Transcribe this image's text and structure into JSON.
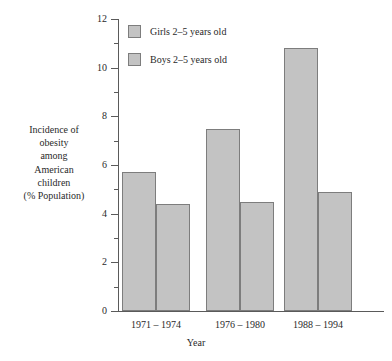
{
  "chart_data": {
    "type": "bar",
    "title": "",
    "xlabel": "Year",
    "ylabel": "Incidence of obesity among American children (% Population)",
    "ylabel_lines": [
      "Incidence of",
      "obesity",
      "among",
      "American",
      "children",
      "(% Population)"
    ],
    "categories": [
      "1971 – 1974",
      "1976 – 1980",
      "1988 – 1994"
    ],
    "series": [
      {
        "name": "Girls 2–5 years old",
        "values": [
          5.7,
          7.5,
          10.8
        ]
      },
      {
        "name": "Boys 2–5 years old",
        "values": [
          4.4,
          4.5,
          4.9
        ]
      }
    ],
    "ylim": [
      0,
      12
    ],
    "y_ticks_major": [
      0,
      2,
      4,
      6,
      8,
      10,
      12
    ],
    "y_tick_labels": [
      "0",
      "2",
      "4",
      "6",
      "8",
      "10",
      "12"
    ],
    "y_ticks_minor": [
      1,
      3,
      5,
      7,
      9,
      11
    ],
    "grid": false,
    "legend_position": "top-left",
    "bar_color": "#c3c3c3",
    "bar_border_color": "#7d7d7d",
    "axis_color": "#5a5a5a",
    "background": "#ffffff"
  }
}
